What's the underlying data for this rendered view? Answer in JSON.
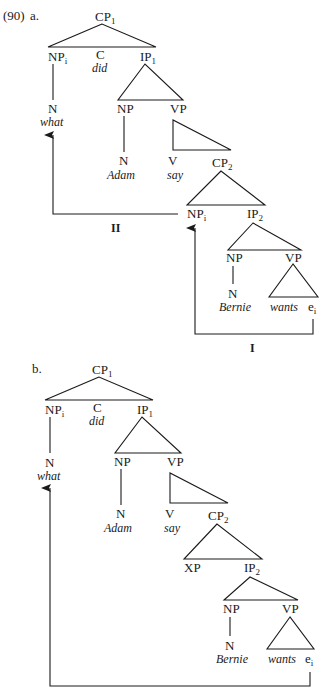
{
  "example_number": "(90)",
  "trees": [
    {
      "id": "a",
      "label": "a.",
      "nodes": {
        "root": {
          "cat": "CP",
          "sub": "1"
        },
        "spec": {
          "cat": "NP",
          "sub": "i"
        },
        "comp": {
          "cat": "C",
          "word": "did"
        },
        "ip1": {
          "cat": "IP",
          "sub": "1"
        },
        "wh_n": {
          "cat": "N",
          "word": "what"
        },
        "subj_np": {
          "cat": "NP"
        },
        "vp1": {
          "cat": "VP"
        },
        "subj_n": {
          "cat": "N",
          "word": "Adam"
        },
        "v": {
          "cat": "V",
          "word": "say"
        },
        "cp2": {
          "cat": "CP",
          "sub": "2"
        },
        "cp2_spec": {
          "cat": "NP",
          "sub": "i"
        },
        "ip2": {
          "cat": "IP",
          "sub": "2"
        },
        "emb_np": {
          "cat": "NP"
        },
        "emb_vp": {
          "cat": "VP"
        },
        "emb_n": {
          "cat": "N",
          "word": "Bernie"
        },
        "emb_v": {
          "word": "wants"
        },
        "trace": {
          "cat": "e",
          "sub": "i"
        }
      },
      "movements": [
        {
          "label": "I",
          "from": "trace",
          "to": "cp2_spec"
        },
        {
          "label": "II",
          "from": "cp2_spec",
          "to": "wh_n"
        }
      ]
    },
    {
      "id": "b",
      "label": "b.",
      "nodes": {
        "root": {
          "cat": "CP",
          "sub": "1"
        },
        "spec": {
          "cat": "NP",
          "sub": "i"
        },
        "comp": {
          "cat": "C",
          "word": "did"
        },
        "ip1": {
          "cat": "IP",
          "sub": "1"
        },
        "wh_n": {
          "cat": "N",
          "word": "what"
        },
        "subj_np": {
          "cat": "NP"
        },
        "vp1": {
          "cat": "VP"
        },
        "subj_n": {
          "cat": "N",
          "word": "Adam"
        },
        "v": {
          "cat": "V",
          "word": "say"
        },
        "cp2": {
          "cat": "CP",
          "sub": "2"
        },
        "cp2_spec": {
          "cat": "XP"
        },
        "ip2": {
          "cat": "IP",
          "sub": "2"
        },
        "emb_np": {
          "cat": "NP"
        },
        "emb_vp": {
          "cat": "VP"
        },
        "emb_n": {
          "cat": "N",
          "word": "Bernie"
        },
        "emb_v": {
          "word": "wants"
        },
        "trace": {
          "cat": "e",
          "sub": "i"
        }
      },
      "movements": [
        {
          "label": "",
          "from": "trace",
          "to": "wh_n"
        }
      ]
    }
  ]
}
